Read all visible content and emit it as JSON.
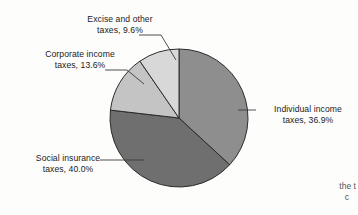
{
  "chart_data": {
    "type": "pie",
    "title": "",
    "subtitle": "",
    "xlabel": "",
    "ylabel": "",
    "legend_position": "callout-labels",
    "grid": false,
    "units": "percent",
    "start_angle_deg": 0,
    "direction": "clockwise",
    "categories": [
      "Individual income taxes",
      "Social insurance taxes",
      "Corporate income taxes",
      "Excise and other taxes"
    ],
    "values": [
      36.9,
      40.0,
      13.6,
      9.6
    ],
    "labels": [
      "Individual income taxes, 36.9%",
      "Social insurance taxes, 40.0%",
      "Corporate income taxes, 13.6%",
      "Excise and other taxes, 9.6%"
    ],
    "slice_colors": [
      "#8e8e8e",
      "#6f6f6f",
      "#c4c4c4",
      "#d8d8d8"
    ],
    "slice_edge_color": "#2b2b2b"
  },
  "figure": {
    "background_color": "#fdfdfb",
    "text_color": "#1b1b1b",
    "leader_line_color": "#3a3a3a",
    "pie": {
      "center_x": 179,
      "center_y": 118,
      "radius": 69
    },
    "slices": [
      {
        "name": "individual-income",
        "category": "Individual income taxes",
        "percent": "36.9%",
        "color": "#8e8e8e"
      },
      {
        "name": "social-insurance",
        "category": "Social insurance taxes",
        "percent": "40.0%",
        "color": "#6f6f6f"
      },
      {
        "name": "corporate-income",
        "category": "Corporate income taxes",
        "percent": "13.6%",
        "color": "#c4c4c4"
      },
      {
        "name": "excise-other",
        "category": "Excise and other taxes",
        "percent": "9.6%",
        "color": "#d8d8d8"
      }
    ]
  },
  "callouts": {
    "excise": {
      "line1": "Excise and other",
      "line2": "taxes, 9.6%"
    },
    "corporate": {
      "line1": "Corporate income",
      "line2": "taxes, 13.6%"
    },
    "social": {
      "line1": "Social insurance",
      "line2": "taxes, 40.0%"
    },
    "individual": {
      "line1": "Individual income",
      "line2": "taxes, 36.9%"
    }
  },
  "page_text": {
    "fragment_line1": "the t",
    "fragment_line2": "c"
  }
}
